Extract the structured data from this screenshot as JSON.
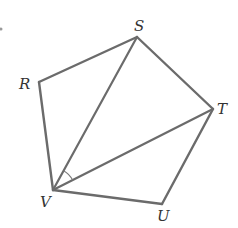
{
  "diagram": {
    "type": "pentagon-with-diagonals",
    "stroke_color": "#6b6b6b",
    "label_color": "#333333",
    "vertices": {
      "S": {
        "x": 137,
        "y": 37,
        "label": "S",
        "label_x": 136,
        "label_y": 31
      },
      "T": {
        "x": 213,
        "y": 109,
        "label": "T",
        "label_x": 217,
        "label_y": 114
      },
      "U": {
        "x": 162,
        "y": 204,
        "label": "U",
        "label_x": 158,
        "label_y": 221
      },
      "V": {
        "x": 53,
        "y": 190,
        "label": "V",
        "label_x": 40,
        "label_y": 208
      },
      "R": {
        "x": 39,
        "y": 82,
        "label": "R",
        "label_x": 20,
        "label_y": 88
      }
    },
    "sides": [
      "RS",
      "ST",
      "TU",
      "UV",
      "VR"
    ],
    "diagonals": [
      "VS",
      "VT"
    ],
    "marked_angle": {
      "vertex": "V",
      "between": [
        "S",
        "T"
      ],
      "label": "angle SVT"
    }
  }
}
